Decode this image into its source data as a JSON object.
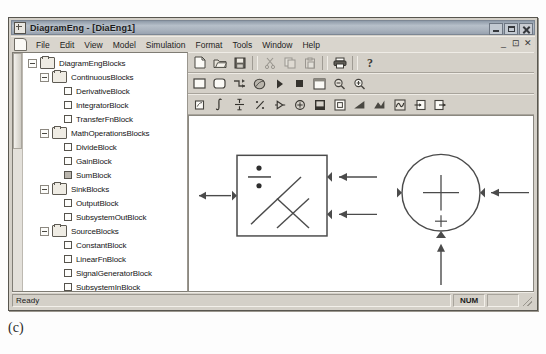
{
  "window": {
    "title": "DiagramEng - [DiaEng1]",
    "title_icon": "window-document-icon",
    "buttons": {
      "minimize": "_",
      "maximize": "□",
      "close": "✕"
    }
  },
  "menu": {
    "doc_icon": "document-icon",
    "items": [
      "File",
      "Edit",
      "View",
      "Model",
      "Simulation",
      "Format",
      "Tools",
      "Window",
      "Help"
    ],
    "mdi_buttons": [
      "_",
      "⊡",
      "✕"
    ]
  },
  "toolbars": [
    {
      "name": "standard-toolbar",
      "buttons": [
        {
          "name": "new-file-button",
          "icon": "new-document-icon",
          "enabled": true
        },
        {
          "name": "open-file-button",
          "icon": "open-folder-icon",
          "enabled": true
        },
        {
          "name": "save-file-button",
          "icon": "floppy-disk-icon",
          "enabled": true
        },
        {
          "name": "separator",
          "icon": "separator",
          "enabled": true
        },
        {
          "name": "cut-button",
          "icon": "scissors-icon",
          "enabled": false
        },
        {
          "name": "copy-button",
          "icon": "copy-pages-icon",
          "enabled": false
        },
        {
          "name": "paste-button",
          "icon": "clipboard-icon",
          "enabled": false
        },
        {
          "name": "separator",
          "icon": "separator",
          "enabled": true
        },
        {
          "name": "print-button",
          "icon": "printer-icon",
          "enabled": true
        },
        {
          "name": "separator",
          "icon": "separator",
          "enabled": true
        },
        {
          "name": "help-button",
          "icon": "question-mark-icon",
          "enabled": true
        }
      ]
    },
    {
      "name": "model-toolbar",
      "buttons": [
        {
          "name": "new-block-button",
          "icon": "square-outline-icon",
          "enabled": true
        },
        {
          "name": "new-subsystem-button",
          "icon": "rounded-square-icon",
          "enabled": true
        },
        {
          "name": "connection-button",
          "icon": "connection-lines-icon",
          "enabled": true
        },
        {
          "name": "ellipse-button",
          "icon": "ellipse-icon",
          "enabled": true
        },
        {
          "name": "run-simulation-button",
          "icon": "play-triangle-icon",
          "enabled": true
        },
        {
          "name": "stop-simulation-button",
          "icon": "stop-square-icon",
          "enabled": true
        },
        {
          "name": "simulation-parameters-button",
          "icon": "window-box-icon",
          "enabled": true
        },
        {
          "name": "zoom-out-button",
          "icon": "magnifier-minus-icon",
          "enabled": true
        },
        {
          "name": "zoom-in-button",
          "icon": "magnifier-plus-icon",
          "enabled": true
        }
      ]
    },
    {
      "name": "blocks-toolbar",
      "buttons": [
        {
          "name": "derivative-block-button",
          "icon": "derivative-icon",
          "enabled": true
        },
        {
          "name": "integrator-block-button",
          "icon": "integral-sign-icon",
          "enabled": true
        },
        {
          "name": "transfer-fn-block-button",
          "icon": "transfer-function-icon",
          "enabled": true
        },
        {
          "name": "divide-block-button",
          "icon": "divide-icon",
          "enabled": true
        },
        {
          "name": "gain-block-button",
          "icon": "gain-triangle-icon",
          "enabled": true
        },
        {
          "name": "sum-block-button",
          "icon": "sum-circle-icon",
          "enabled": true
        },
        {
          "name": "output-block-button",
          "icon": "output-scope-icon",
          "enabled": true
        },
        {
          "name": "subsystem-out-block-button",
          "icon": "subsystem-out-icon",
          "enabled": true
        },
        {
          "name": "constant-block-button",
          "icon": "constant-ramp-icon",
          "enabled": true
        },
        {
          "name": "linear-fn-block-button",
          "icon": "linear-fn-icon",
          "enabled": true
        },
        {
          "name": "signal-generator-block-button",
          "icon": "signal-generator-icon",
          "enabled": true
        },
        {
          "name": "subsystem-in-block-button",
          "icon": "subsystem-in-icon",
          "enabled": true
        },
        {
          "name": "subsystem-block-button",
          "icon": "subsystem-icon",
          "enabled": true
        }
      ]
    }
  ],
  "tree": {
    "nodes": [
      {
        "label": "DiagramEngBlocks",
        "depth": 0,
        "type": "folder",
        "expander": "minus"
      },
      {
        "label": "ContinuousBlocks",
        "depth": 1,
        "type": "folder",
        "expander": "minus"
      },
      {
        "label": "DerivativeBlock",
        "depth": 2,
        "type": "leaf",
        "expander": "none"
      },
      {
        "label": "IntegratorBlock",
        "depth": 2,
        "type": "leaf",
        "expander": "none"
      },
      {
        "label": "TransferFnBlock",
        "depth": 2,
        "type": "leaf",
        "expander": "none"
      },
      {
        "label": "MathOperationsBlocks",
        "depth": 1,
        "type": "folder",
        "expander": "minus"
      },
      {
        "label": "DivideBlock",
        "depth": 2,
        "type": "leaf",
        "expander": "none"
      },
      {
        "label": "GainBlock",
        "depth": 2,
        "type": "leaf",
        "expander": "none"
      },
      {
        "label": "SumBlock",
        "depth": 2,
        "type": "leaf",
        "expander": "none"
      },
      {
        "label": "SinkBlocks",
        "depth": 1,
        "type": "folder",
        "expander": "minus"
      },
      {
        "label": "OutputBlock",
        "depth": 2,
        "type": "leaf",
        "expander": "none"
      },
      {
        "label": "SubsystemOutBlock",
        "depth": 2,
        "type": "leaf",
        "expander": "none"
      },
      {
        "label": "SourceBlocks",
        "depth": 1,
        "type": "folder",
        "expander": "minus"
      },
      {
        "label": "ConstantBlock",
        "depth": 2,
        "type": "leaf",
        "expander": "none"
      },
      {
        "label": "LinearFnBlock",
        "depth": 2,
        "type": "leaf",
        "expander": "none"
      },
      {
        "label": "SignalGeneratorBlock",
        "depth": 2,
        "type": "leaf",
        "expander": "none"
      },
      {
        "label": "SubsystemInBlock",
        "depth": 2,
        "type": "leaf",
        "expander": "none"
      },
      {
        "label": "SubsystemBlocks",
        "depth": 1,
        "type": "folder",
        "expander": "plus"
      }
    ]
  },
  "canvas": {
    "name": "diagram-canvas",
    "blocks": [
      {
        "name": "divide-block",
        "shape": "rectangle",
        "x": 235,
        "y": 155,
        "width": 92,
        "height": 80,
        "symbols": [
          "divide-symbol",
          "diagonal-slash",
          "multiply-cross"
        ],
        "ports": [
          {
            "name": "divide-block-input-port-1",
            "side": "right",
            "offset": 0.28
          },
          {
            "name": "divide-block-input-port-2",
            "side": "right",
            "offset": 0.66
          },
          {
            "name": "divide-block-output-port",
            "side": "left",
            "offset": 0.5
          }
        ]
      },
      {
        "name": "sum-block",
        "shape": "circle",
        "cx": 443,
        "cy": 189,
        "r": 39,
        "symbols": [
          "plus-sign-center",
          "plus-sign-bottom"
        ],
        "ports": [
          {
            "name": "sum-block-input-port-right",
            "side": "right",
            "offset": 0.5
          },
          {
            "name": "sum-block-input-port-bottom",
            "side": "bottom",
            "offset": 0.5
          },
          {
            "name": "sum-block-output-port",
            "side": "left",
            "offset": 0.5
          }
        ]
      }
    ],
    "connections": [
      {
        "name": "connection-divide-output",
        "from": "divide-block-output-port",
        "to": "canvas-left-edge",
        "direction": "left"
      },
      {
        "name": "connection-to-divide-input-1",
        "from": "sum-block-output-port",
        "to": "divide-block-input-port-1",
        "direction": "left"
      },
      {
        "name": "connection-to-divide-input-2",
        "from": "branch-point",
        "to": "divide-block-input-port-2",
        "direction": "left"
      },
      {
        "name": "connection-sum-input-right",
        "from": "canvas-right-edge",
        "to": "sum-block-input-port-right",
        "direction": "left"
      },
      {
        "name": "connection-sum-input-bottom",
        "from": "canvas-bottom",
        "to": "sum-block-input-port-bottom",
        "direction": "up"
      }
    ]
  },
  "status_bar": {
    "message": "Ready",
    "panes": [
      "NUM"
    ]
  },
  "figure": {
    "caption": "(c)"
  },
  "colors": {
    "window_face": "#d4d0c8",
    "title_gradient_start": "#8e9aa8",
    "title_gradient_end": "#99a3b0",
    "canvas_background": "#ffffff",
    "text": "#151515"
  }
}
